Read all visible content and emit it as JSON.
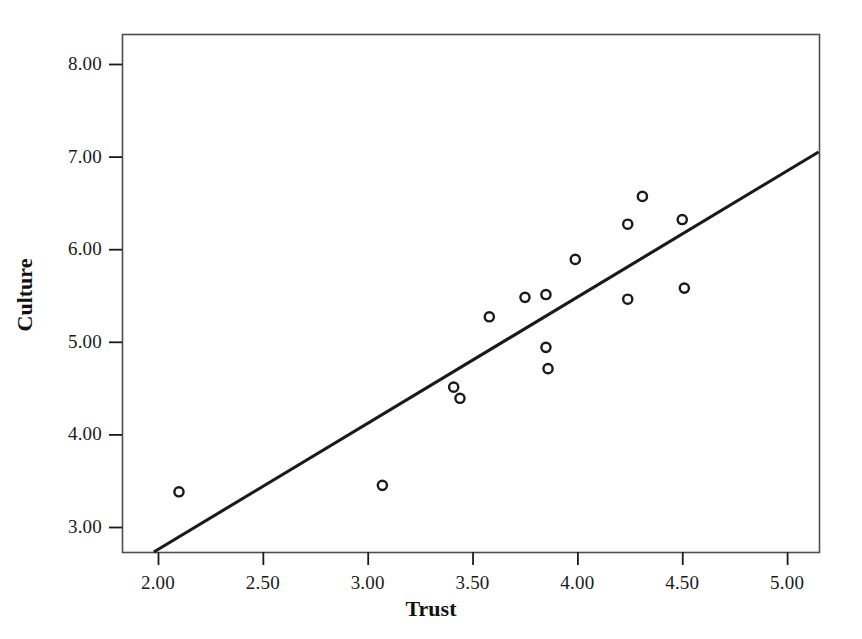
{
  "chart_data": {
    "type": "scatter",
    "title": "",
    "xlabel": "Trust",
    "ylabel": "Culture",
    "xlim": [
      1.83,
      5.15
    ],
    "ylim": [
      2.73,
      8.27
    ],
    "xticks": [
      "2.00",
      "2.50",
      "3.00",
      "3.50",
      "4.00",
      "4.50",
      "5.00"
    ],
    "xtick_values": [
      2.0,
      2.5,
      3.0,
      3.5,
      4.0,
      4.5,
      5.0
    ],
    "yticks": [
      "8.00",
      "7.00",
      "6.00",
      "5.00",
      "4.00",
      "3.00"
    ],
    "ytick_values": [
      8.0,
      7.0,
      6.0,
      5.0,
      4.0,
      3.0
    ],
    "grid": false,
    "legend": null,
    "marker": "open-circle",
    "marker_color": "#1a1a1a",
    "line_color": "#1a1a1a",
    "frame_color": "#4d4d4d",
    "background": "#ffffff",
    "x": [
      2.1,
      3.07,
      3.41,
      3.44,
      3.58,
      3.75,
      3.85,
      3.85,
      3.86,
      3.99,
      4.24,
      4.24,
      4.31,
      4.5,
      4.51
    ],
    "y": [
      3.38,
      3.45,
      4.51,
      4.39,
      5.27,
      5.48,
      5.51,
      4.94,
      4.71,
      5.89,
      6.27,
      5.46,
      6.57,
      6.32,
      5.58
    ],
    "points": [
      {
        "x": 2.1,
        "y": 3.38
      },
      {
        "x": 3.07,
        "y": 3.45
      },
      {
        "x": 3.41,
        "y": 4.51
      },
      {
        "x": 3.44,
        "y": 4.39
      },
      {
        "x": 3.58,
        "y": 5.27
      },
      {
        "x": 3.75,
        "y": 5.48
      },
      {
        "x": 3.85,
        "y": 5.51
      },
      {
        "x": 3.85,
        "y": 4.94
      },
      {
        "x": 3.86,
        "y": 4.71
      },
      {
        "x": 3.99,
        "y": 5.89
      },
      {
        "x": 4.24,
        "y": 6.27
      },
      {
        "x": 4.24,
        "y": 5.46
      },
      {
        "x": 4.31,
        "y": 6.57
      },
      {
        "x": 4.5,
        "y": 6.32
      },
      {
        "x": 4.51,
        "y": 5.58
      }
    ],
    "fit_line": {
      "name": "linear-fit",
      "x_start": 1.98,
      "y_start": 2.73,
      "x_end": 5.15,
      "y_end": 7.05
    }
  },
  "axes": {
    "x_title": "Trust",
    "y_title": "Culture"
  }
}
